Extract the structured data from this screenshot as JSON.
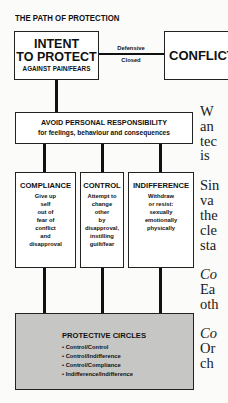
{
  "diagram": {
    "title": "THE PATH OF PROTECTION",
    "intent_box": {
      "line1": "INTENT",
      "line2": "TO PROTECT",
      "line3": "AGAINST PAIN/FEARS"
    },
    "link_labels": [
      "Defensive",
      "Closed"
    ],
    "conflict_box": {
      "label": "CONFLICT"
    },
    "avoid_box": {
      "heading": "AVOID PERSONAL RESPONSIBILITY",
      "subheading": "for feelings, behaviour and consequences"
    },
    "columns": [
      {
        "heading": "COMPLIANCE",
        "lines": [
          "Give up",
          "self",
          "out of",
          "fear of",
          "conflict",
          "and",
          "disapproval"
        ]
      },
      {
        "heading": "CONTROL",
        "lines": [
          "Attempt to",
          "change",
          "other",
          "by",
          "disapproval,",
          "instilling",
          "guilt/fear"
        ]
      },
      {
        "heading": "INDIFFERENCE",
        "lines": [
          "Withdraw",
          "or resist:",
          "sexually",
          "emotionally",
          "physically"
        ]
      }
    ],
    "protective_circles": {
      "heading": "PROTECTIVE CIRCLES",
      "items": [
        "• Control/Control",
        "• Control/Indifference",
        "• Control/Compliance",
        "• Indifference/Indifference"
      ]
    },
    "colors": {
      "line": "#111111",
      "box_fill": "#ffffff",
      "circles_fill": "#c6c6c4",
      "background": "#fbfbf9"
    }
  },
  "prose_fragments": [
    {
      "text": "W",
      "italic": false,
      "top": 104
    },
    {
      "text": "an",
      "italic": false,
      "top": 119
    },
    {
      "text": "tec",
      "italic": false,
      "top": 134
    },
    {
      "text": "is",
      "italic": false,
      "top": 148
    },
    {
      "text": "Sin",
      "italic": false,
      "top": 178
    },
    {
      "text": "va",
      "italic": false,
      "top": 193
    },
    {
      "text": "the",
      "italic": false,
      "top": 208
    },
    {
      "text": "cle",
      "italic": false,
      "top": 223
    },
    {
      "text": "sta",
      "italic": false,
      "top": 238
    },
    {
      "text": "Co",
      "italic": true,
      "top": 267
    },
    {
      "text": "Ea",
      "italic": false,
      "top": 282
    },
    {
      "text": "oth",
      "italic": false,
      "top": 297
    },
    {
      "text": "Co",
      "italic": true,
      "top": 326
    },
    {
      "text": "Or",
      "italic": false,
      "top": 341
    },
    {
      "text": "ch",
      "italic": false,
      "top": 356
    }
  ]
}
